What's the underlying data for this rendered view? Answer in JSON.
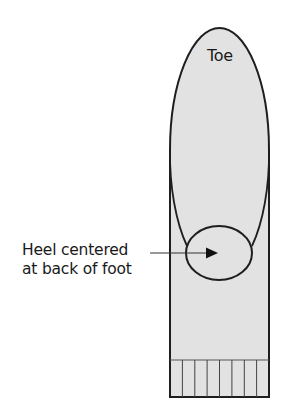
{
  "diagram": {
    "type": "sock-heel-placement",
    "labels": {
      "toe": "Toe",
      "heel_line1": "Heel centered",
      "heel_line2": "at back of foot"
    },
    "colors": {
      "fill": "#e2e2e2",
      "stroke": "#1e1e1e",
      "background": "#ffffff",
      "text": "#1a1a1a"
    },
    "shapes": {
      "foot_rect": {
        "x": 170,
        "y": 120,
        "width": 99,
        "height": 277
      },
      "toe_ellipse": {
        "cx": 219.5,
        "cy": 150,
        "rx": 49.5,
        "ry": 122
      },
      "heel_ellipse": {
        "cx": 219,
        "cy": 253,
        "rx": 33,
        "ry": 27
      },
      "ribbing": {
        "top": 360,
        "bottom": 397,
        "columns": 8
      },
      "arrow": {
        "x1": 150,
        "y1": 253,
        "x2": 218,
        "y2": 253
      }
    }
  }
}
